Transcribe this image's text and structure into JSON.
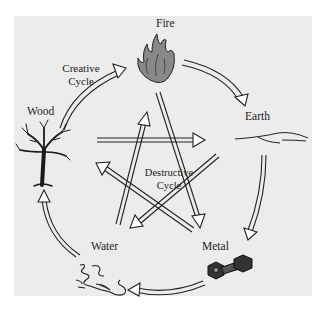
{
  "diagram": {
    "elements": [
      {
        "id": "fire",
        "label": "Fire",
        "icon": "flame-icon"
      },
      {
        "id": "earth",
        "label": "Earth",
        "icon": "ground-icon"
      },
      {
        "id": "metal",
        "label": "Metal",
        "icon": "dumbbell-icon"
      },
      {
        "id": "water",
        "label": "Water",
        "icon": "puddle-icon"
      },
      {
        "id": "wood",
        "label": "Wood",
        "icon": "tree-icon"
      }
    ],
    "creative_cycle": {
      "label_line1": "Creative",
      "label_line2": "Cycle",
      "order": [
        "Wood",
        "Fire",
        "Earth",
        "Metal",
        "Water",
        "Wood"
      ]
    },
    "destructive_cycle": {
      "label_line1": "Destructive",
      "label_line2": "Cycle",
      "order": [
        "Wood",
        "Earth",
        "Water",
        "Fire",
        "Metal",
        "Wood"
      ]
    },
    "colors": {
      "background": "#ffffff",
      "panel": "#ececec",
      "ink": "#222222"
    }
  }
}
